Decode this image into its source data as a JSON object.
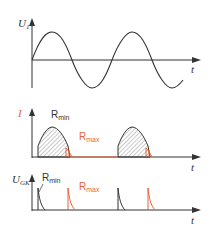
{
  "colors": {
    "axis": "#333333",
    "curve": "#333333",
    "accent": "#e8643c",
    "hatch": "#777777",
    "background": "#ffffff"
  },
  "panels": [
    {
      "id": "voltage",
      "y_label_main": "U",
      "y_label_sub": "1",
      "x_label": "t",
      "description": "sinusoidal supply voltage U1 over time"
    },
    {
      "id": "current",
      "y_label_main": "I",
      "x_label": "t",
      "curve_labels": {
        "r_min_main": "R",
        "r_min_sub": "min",
        "r_max_main": "R",
        "r_max_sub": "max"
      },
      "description": "load current pulses (hatched) for R_min and R_max during positive half-waves"
    },
    {
      "id": "gate-voltage",
      "y_label_main": "U",
      "y_label_sub": "GK",
      "x_label": "t",
      "curve_labels": {
        "r_min_main": "R",
        "r_min_sub": "min",
        "r_max_main": "R",
        "r_max_sub": "max"
      },
      "description": "gate-cathode trigger pulses for R_min (early) and R_max (late)"
    }
  ]
}
